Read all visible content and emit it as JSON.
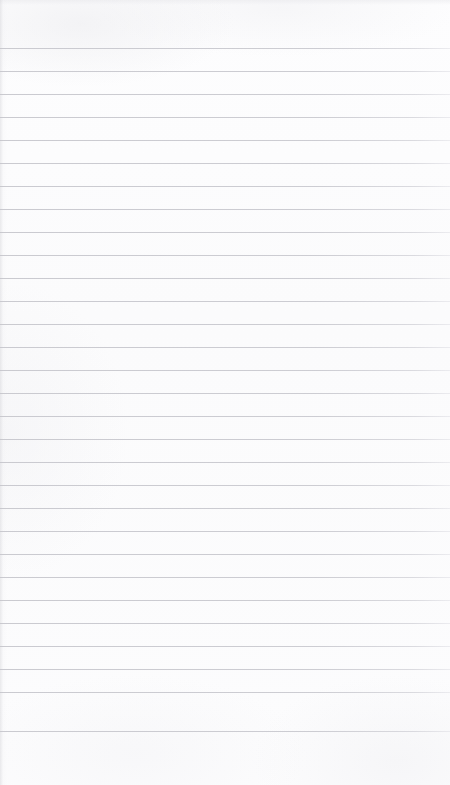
{
  "document": {
    "kind": "ruled-notebook-paper",
    "title": "Blank lined page",
    "content_text": "",
    "handwriting_present": "no",
    "printed_text_present": "no"
  },
  "page": {
    "width_px": 450,
    "height_px": 785,
    "background_color": "#fcfcfd",
    "paper_tone": "near-white",
    "texture": "faint scan mottling"
  },
  "ruling": {
    "style": "horizontal ruled lines",
    "line_color": "#c9c9cf",
    "line_thickness_px": 1,
    "first_line_y_px": 48,
    "line_spacing_px": 23,
    "line_count": 30,
    "last_line_y_px": 731,
    "left_inset_px": 0,
    "right_inset_px": 0,
    "top_margin_px": 48,
    "bottom_margin_px": 54,
    "vertical_margin_rule": "none",
    "line_y_positions": [
      48,
      71,
      94,
      117,
      140,
      163,
      186,
      209,
      232,
      255,
      278,
      301,
      324,
      347,
      370,
      393,
      416,
      439,
      462,
      485,
      508,
      531,
      554,
      577,
      600,
      623,
      646,
      669,
      692,
      731
    ]
  },
  "edges": {
    "left_shadow_color": "#cdcdd2",
    "top_shadow_color": "#e2e2e6"
  }
}
